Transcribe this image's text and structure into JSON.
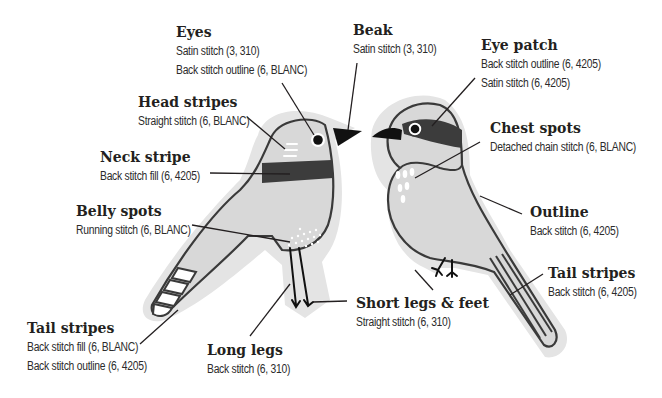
{
  "colors": {
    "halo": "#e3e3e3",
    "body": "#d9d9d9",
    "outline": "#3a3a3a",
    "dark_stripe": "#3c3c3c",
    "black": "#111111",
    "white": "#ffffff",
    "leader_line": "#231f20"
  },
  "labels": {
    "eyes": {
      "title": "Eyes",
      "lines": [
        "Satin stitch (3, 310)",
        "Back stitch outline (6, BLANC)"
      ]
    },
    "beak": {
      "title": "Beak",
      "lines": [
        "Satin stitch (3, 310)"
      ]
    },
    "eye_patch": {
      "title": "Eye patch",
      "lines": [
        "Back stitch outline (6, 4205)",
        "Satin stitch (6, 4205)"
      ]
    },
    "head_stripes": {
      "title": "Head stripes",
      "lines": [
        "Straight stitch (6, BLANC)"
      ]
    },
    "chest_spots": {
      "title": "Chest spots",
      "lines": [
        "Detached chain stitch (6, BLANC)"
      ]
    },
    "neck_stripe": {
      "title": "Neck stripe",
      "lines": [
        "Back stitch fill (6, 4205)"
      ]
    },
    "belly_spots": {
      "title": "Belly spots",
      "lines": [
        "Running stitch (6, BLANC)"
      ]
    },
    "outline": {
      "title": "Outline",
      "lines": [
        "Back stitch (6, 4205)"
      ]
    },
    "tail_stripes_right": {
      "title": "Tail stripes",
      "lines": [
        "Back stitch (6, 4205)"
      ]
    },
    "short_legs": {
      "title": "Short legs & feet",
      "lines": [
        "Straight stitch (6, 310)"
      ]
    },
    "tail_stripes_left": {
      "title": "Tail stripes",
      "lines": [
        "Back stitch fill (6, BLANC)",
        "Back stitch outline (6, 4205)"
      ]
    },
    "long_legs": {
      "title": "Long legs",
      "lines": [
        "Back stitch (6, 310)"
      ]
    }
  },
  "birds": [
    {
      "name": "left-bird",
      "features": [
        "eyes",
        "beak",
        "head stripes",
        "neck stripe",
        "belly spots",
        "long legs",
        "tail stripes"
      ]
    },
    {
      "name": "right-bird",
      "features": [
        "eye patch",
        "chest spots",
        "outline",
        "short legs & feet",
        "tail stripes"
      ]
    }
  ]
}
